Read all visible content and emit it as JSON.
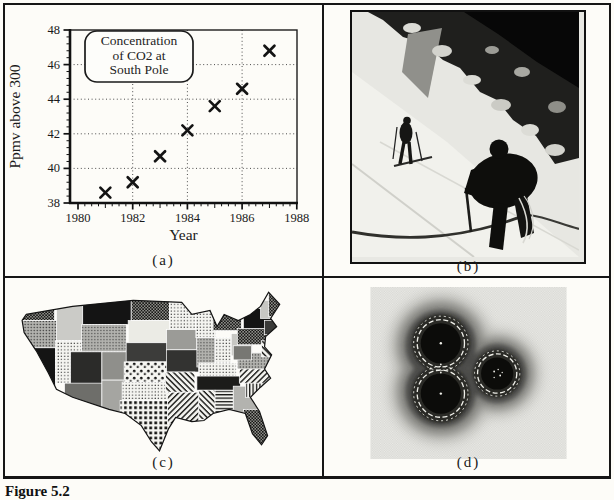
{
  "page": {
    "figure_label": "Figure 5.2",
    "paper_color": "#fdfcf8",
    "ink_color": "#161616"
  },
  "panels": {
    "a": {
      "caption": "(a)",
      "content": "scatter-chart"
    },
    "b": {
      "caption": "(b)",
      "content": "mountaineers-photo"
    },
    "c": {
      "caption": "(c)",
      "content": "us-states-pattern-map"
    },
    "d": {
      "caption": "(d)",
      "content": "grayscale-contour-field-image"
    }
  },
  "chart_data": {
    "type": "scatter",
    "marker": "x",
    "x": [
      1981,
      1982,
      1983,
      1984,
      1985,
      1986,
      1987
    ],
    "y": [
      38.6,
      39.2,
      40.7,
      42.2,
      43.6,
      44.6,
      46.8
    ],
    "xlabel": "Year",
    "ylabel": "Ppmv above 300",
    "xlim": [
      1980,
      1988
    ],
    "ylim": [
      38,
      48
    ],
    "xticks": [
      1980,
      1982,
      1984,
      1986,
      1988
    ],
    "yticks": [
      38,
      40,
      42,
      44,
      46,
      48
    ],
    "grid": "dotted",
    "annotation_lines": [
      "Concentration",
      "of CO2 at",
      "South Pole"
    ]
  }
}
